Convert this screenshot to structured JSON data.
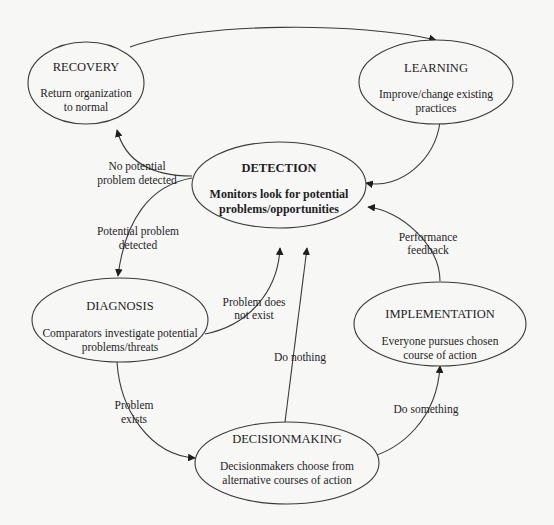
{
  "diagram": {
    "nodes": {
      "recovery": {
        "title": "RECOVERY",
        "desc": [
          "Return organization",
          "to normal"
        ]
      },
      "learning": {
        "title": "LEARNING",
        "desc": [
          "Improve/change existing",
          "practices"
        ]
      },
      "detection": {
        "title": "DETECTION",
        "desc": [
          "Monitors look for potential",
          "problems/opportunities"
        ]
      },
      "diagnosis": {
        "title": "DIAGNOSIS",
        "desc": [
          "Comparators investigate potential",
          "problems/threats"
        ]
      },
      "implementation": {
        "title": "IMPLEMENTATION",
        "desc": [
          "Everyone pursues chosen",
          "course of action"
        ]
      },
      "decisionmaking": {
        "title": "DECISIONMAKING",
        "desc": [
          "Decisionmakers choose from",
          "alternative courses of action"
        ]
      }
    },
    "edges": {
      "no_problem": [
        "No potential",
        "problem detected"
      ],
      "potential_problem": [
        "Potential problem",
        "detected"
      ],
      "problem_not_exist": [
        "Problem does",
        "not exist"
      ],
      "problem_exists": [
        "Problem",
        "exists"
      ],
      "do_nothing": "Do nothing",
      "do_something": "Do something",
      "performance_feedback": [
        "Performance",
        "feedback"
      ]
    }
  }
}
